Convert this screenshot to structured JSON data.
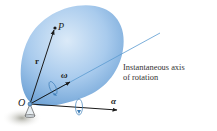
{
  "diagram": {
    "labels": {
      "point_p": "P",
      "origin": "O",
      "position_vector": "r",
      "angular_velocity": "ω",
      "angular_acceleration": "α"
    },
    "caption": {
      "line1": "Instantaneous axis",
      "line2": "of rotation"
    },
    "colors": {
      "body_light": "#cfe3f6",
      "body_mid": "#9cc4ea",
      "body_dark": "#6ea4d8",
      "axis_line": "#5a9bd0",
      "vector": "#1a1a1a",
      "shadow": "#b9b9b0"
    }
  }
}
